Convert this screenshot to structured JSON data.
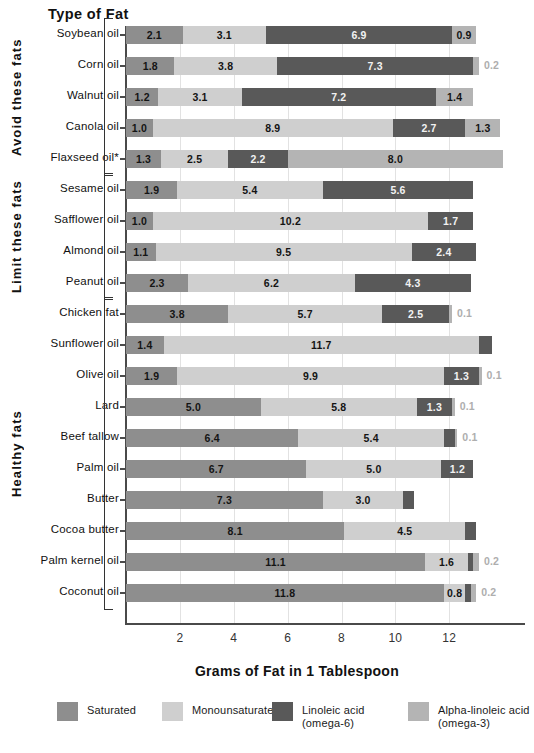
{
  "header": {
    "column_title": "Type of Fat"
  },
  "axis": {
    "x_title": "Grams of Fat in 1 Tablespoon",
    "x_ticks": [
      "2",
      "4",
      "6",
      "8",
      "10",
      "12"
    ],
    "x_min": 0,
    "x_max": 14.7
  },
  "groups": [
    {
      "label": "Avoid these fats",
      "count": 5
    },
    {
      "label": "Limit these fats",
      "count": 4
    },
    {
      "label": "Healthy fats",
      "count": 10
    }
  ],
  "legend": [
    {
      "key": "sat",
      "label": "Saturated",
      "sub": "",
      "color": "#8e8e8e"
    },
    {
      "key": "mono",
      "label": "Monounsaturated",
      "sub": "",
      "color": "#cfcfcf"
    },
    {
      "key": "lin",
      "label": "Linoleic acid",
      "sub": "(omega-6)",
      "color": "#595959"
    },
    {
      "key": "ala",
      "label": "Alpha-linoleic acid",
      "sub": "(omega-3)",
      "color": "#b4b4b4"
    }
  ],
  "chart_data": {
    "type": "bar",
    "orientation": "horizontal",
    "stacked": true,
    "title": "",
    "xlabel": "Grams of Fat in 1 Tablespoon",
    "ylabel": "Type of Fat",
    "xlim": [
      0,
      14.7
    ],
    "grid": true,
    "legend_position": "bottom",
    "series": [
      {
        "name": "Saturated",
        "key": "sat",
        "color": "#8e8e8e"
      },
      {
        "name": "Monounsaturated",
        "key": "mono",
        "color": "#cfcfcf"
      },
      {
        "name": "Linoleic acid (omega-6)",
        "key": "lin",
        "color": "#595959"
      },
      {
        "name": "Alpha-linoleic acid (omega-3)",
        "key": "ala",
        "color": "#b4b4b4"
      }
    ],
    "categories": [
      "Soybean oil",
      "Corn oil",
      "Walnut oil",
      "Canola oil",
      "Flaxseed oil*",
      "Sesame oil",
      "Safflower oil",
      "Almond oil",
      "Peanut oil",
      "Chicken fat",
      "Sunflower oil",
      "Olive oil",
      "Lard",
      "Beef tallow",
      "Palm oil",
      "Butter",
      "Cocoa butter",
      "Palm kernel oil",
      "Coconut oil"
    ],
    "rows": [
      {
        "category": "Soybean oil",
        "group": 0,
        "segments": [
          {
            "key": "sat",
            "value": 2.1,
            "label": "2.1",
            "outside": false
          },
          {
            "key": "mono",
            "value": 3.1,
            "label": "3.1",
            "outside": false
          },
          {
            "key": "lin",
            "value": 6.9,
            "label": "6.9",
            "outside": false
          },
          {
            "key": "ala",
            "value": 0.9,
            "label": "0.9",
            "outside": false
          }
        ]
      },
      {
        "category": "Corn oil",
        "group": 0,
        "segments": [
          {
            "key": "sat",
            "value": 1.8,
            "label": "1.8",
            "outside": false
          },
          {
            "key": "mono",
            "value": 3.8,
            "label": "3.8",
            "outside": false
          },
          {
            "key": "lin",
            "value": 7.3,
            "label": "7.3",
            "outside": false
          },
          {
            "key": "ala",
            "value": 0.2,
            "label": "0.2",
            "outside": true
          }
        ]
      },
      {
        "category": "Walnut oil",
        "group": 0,
        "segments": [
          {
            "key": "sat",
            "value": 1.2,
            "label": "1.2",
            "outside": false
          },
          {
            "key": "mono",
            "value": 3.1,
            "label": "3.1",
            "outside": false
          },
          {
            "key": "lin",
            "value": 7.2,
            "label": "7.2",
            "outside": false
          },
          {
            "key": "ala",
            "value": 1.4,
            "label": "1.4",
            "outside": false
          }
        ]
      },
      {
        "category": "Canola oil",
        "group": 0,
        "segments": [
          {
            "key": "sat",
            "value": 1.0,
            "label": "1.0",
            "outside": false
          },
          {
            "key": "mono",
            "value": 8.9,
            "label": "8.9",
            "outside": false
          },
          {
            "key": "lin",
            "value": 2.7,
            "label": "2.7",
            "outside": false
          },
          {
            "key": "ala",
            "value": 1.3,
            "label": "1.3",
            "outside": false
          }
        ]
      },
      {
        "category": "Flaxseed oil*",
        "group": 0,
        "segments": [
          {
            "key": "sat",
            "value": 1.3,
            "label": "1.3",
            "outside": false
          },
          {
            "key": "mono",
            "value": 2.5,
            "label": "2.5",
            "outside": false
          },
          {
            "key": "lin",
            "value": 2.2,
            "label": "2.2",
            "outside": false
          },
          {
            "key": "ala",
            "value": 8.0,
            "label": "8.0",
            "outside": false
          }
        ]
      },
      {
        "category": "Sesame oil",
        "group": 1,
        "segments": [
          {
            "key": "sat",
            "value": 1.9,
            "label": "1.9",
            "outside": false
          },
          {
            "key": "mono",
            "value": 5.4,
            "label": "5.4",
            "outside": false
          },
          {
            "key": "lin",
            "value": 5.6,
            "label": "5.6",
            "outside": false
          }
        ]
      },
      {
        "category": "Safflower oil",
        "group": 1,
        "segments": [
          {
            "key": "sat",
            "value": 1.0,
            "label": "1.0",
            "outside": false
          },
          {
            "key": "mono",
            "value": 10.2,
            "label": "10.2",
            "outside": false
          },
          {
            "key": "lin",
            "value": 1.7,
            "label": "1.7",
            "outside": false
          }
        ]
      },
      {
        "category": "Almond oil",
        "group": 1,
        "segments": [
          {
            "key": "sat",
            "value": 1.1,
            "label": "1.1",
            "outside": false
          },
          {
            "key": "mono",
            "value": 9.5,
            "label": "9.5",
            "outside": false
          },
          {
            "key": "lin",
            "value": 2.4,
            "label": "2.4",
            "outside": false
          }
        ]
      },
      {
        "category": "Peanut oil",
        "group": 1,
        "segments": [
          {
            "key": "sat",
            "value": 2.3,
            "label": "2.3",
            "outside": false
          },
          {
            "key": "mono",
            "value": 6.2,
            "label": "6.2",
            "outside": false
          },
          {
            "key": "lin",
            "value": 4.3,
            "label": "4.3",
            "outside": false
          }
        ]
      },
      {
        "category": "Chicken fat",
        "group": 2,
        "segments": [
          {
            "key": "sat",
            "value": 3.8,
            "label": "3.8",
            "outside": false
          },
          {
            "key": "mono",
            "value": 5.7,
            "label": "5.7",
            "outside": false
          },
          {
            "key": "lin",
            "value": 2.5,
            "label": "2.5",
            "outside": false
          },
          {
            "key": "ala",
            "value": 0.1,
            "label": "0.1",
            "outside": true
          }
        ]
      },
      {
        "category": "Sunflower oil",
        "group": 2,
        "segments": [
          {
            "key": "sat",
            "value": 1.4,
            "label": "1.4",
            "outside": false
          },
          {
            "key": "mono",
            "value": 11.7,
            "label": "11.7",
            "outside": false
          },
          {
            "key": "lin",
            "value": 0.5,
            "label": "0.5",
            "outside": false
          }
        ]
      },
      {
        "category": "Olive oil",
        "group": 2,
        "segments": [
          {
            "key": "sat",
            "value": 1.9,
            "label": "1.9",
            "outside": false
          },
          {
            "key": "mono",
            "value": 9.9,
            "label": "9.9",
            "outside": false
          },
          {
            "key": "lin",
            "value": 1.3,
            "label": "1.3",
            "outside": false
          },
          {
            "key": "ala",
            "value": 0.1,
            "label": "0.1",
            "outside": true
          }
        ]
      },
      {
        "category": "Lard",
        "group": 2,
        "segments": [
          {
            "key": "sat",
            "value": 5.0,
            "label": "5.0",
            "outside": false
          },
          {
            "key": "mono",
            "value": 5.8,
            "label": "5.8",
            "outside": false
          },
          {
            "key": "lin",
            "value": 1.3,
            "label": "1.3",
            "outside": false
          },
          {
            "key": "ala",
            "value": 0.1,
            "label": "0.1",
            "outside": true
          }
        ]
      },
      {
        "category": "Beef tallow",
        "group": 2,
        "segments": [
          {
            "key": "sat",
            "value": 6.4,
            "label": "6.4",
            "outside": false
          },
          {
            "key": "mono",
            "value": 5.4,
            "label": "5.4",
            "outside": false
          },
          {
            "key": "lin",
            "value": 0.4,
            "label": "0.4",
            "outside": false
          },
          {
            "key": "ala",
            "value": 0.1,
            "label": "0.1",
            "outside": true
          }
        ]
      },
      {
        "category": "Palm oil",
        "group": 2,
        "segments": [
          {
            "key": "sat",
            "value": 6.7,
            "label": "6.7",
            "outside": false
          },
          {
            "key": "mono",
            "value": 5.0,
            "label": "5.0",
            "outside": false
          },
          {
            "key": "lin",
            "value": 1.2,
            "label": "1.2",
            "outside": false
          }
        ]
      },
      {
        "category": "Butter",
        "group": 2,
        "segments": [
          {
            "key": "sat",
            "value": 7.3,
            "label": "7.3",
            "outside": false
          },
          {
            "key": "mono",
            "value": 3.0,
            "label": "3.0",
            "outside": false
          },
          {
            "key": "lin",
            "value": 0.4,
            "label": "0.4",
            "outside": false
          }
        ]
      },
      {
        "category": "Cocoa butter",
        "group": 2,
        "segments": [
          {
            "key": "sat",
            "value": 8.1,
            "label": "8.1",
            "outside": false
          },
          {
            "key": "mono",
            "value": 4.5,
            "label": "4.5",
            "outside": false
          },
          {
            "key": "lin",
            "value": 0.4,
            "label": "0.4",
            "outside": false
          }
        ]
      },
      {
        "category": "Palm kernel oil",
        "group": 2,
        "segments": [
          {
            "key": "sat",
            "value": 11.1,
            "label": "11.1",
            "outside": false
          },
          {
            "key": "mono",
            "value": 1.6,
            "label": "1.6",
            "outside": false
          },
          {
            "key": "lin",
            "value": 0.2,
            "label": "0.2",
            "outside": false
          },
          {
            "key": "ala",
            "value": 0.2,
            "label": "0.2",
            "outside": true
          }
        ]
      },
      {
        "category": "Coconut oil",
        "group": 2,
        "segments": [
          {
            "key": "sat",
            "value": 11.8,
            "label": "11.8",
            "outside": false
          },
          {
            "key": "mono",
            "value": 0.8,
            "label": "0.8",
            "outside": false
          },
          {
            "key": "lin",
            "value": 0.2,
            "label": "0.2",
            "outside": false
          },
          {
            "key": "ala",
            "value": 0.2,
            "label": "0.2",
            "outside": true
          }
        ]
      }
    ]
  }
}
